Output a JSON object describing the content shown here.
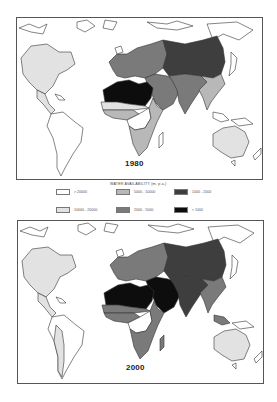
{
  "maps": [
    {
      "year": "1980",
      "region_classes": {
        "north_america": "c10000_20000",
        "central_america": "c10000_20000",
        "south_america": "c_gt20000",
        "europe": "c2000_5000",
        "north_africa": "c_lt1000",
        "sahel": "c10000_20000",
        "west_africa": "c5000_10000",
        "central_africa": "c_gt20000",
        "east_southern_africa": "c5000_10000",
        "middle_east": "c2000_5000",
        "central_asia_china": "c1000_2000",
        "south_asia": "c2000_5000",
        "southeast_asia": "c5000_10000",
        "australia": "c10000_20000"
      }
    },
    {
      "year": "2000",
      "region_classes": {
        "north_america": "c10000_20000",
        "central_america": "c10000_20000",
        "south_america": "c_gt20000",
        "south_america_andes": "c10000_20000",
        "europe": "c2000_5000",
        "north_africa": "c_lt1000",
        "sahel": "c2000_5000",
        "west_africa": "c2000_5000",
        "central_africa": "c_gt20000",
        "east_southern_africa": "c2000_5000",
        "middle_east": "c_lt1000",
        "central_asia_china": "c1000_2000",
        "south_asia": "c1000_2000",
        "southeast_asia": "c2000_5000",
        "australia": "c10000_20000"
      }
    }
  ],
  "legend": {
    "title": "WATER AVAILABILITY  (m³ p.a.)",
    "items": [
      {
        "key": "c_gt20000",
        "label": "> 20000",
        "color": "#ffffff"
      },
      {
        "key": "c10000_20000",
        "label": "10000 - 20000",
        "color": "#e2e2e2"
      },
      {
        "key": "c5000_10000",
        "label": "5000 - 10000",
        "color": "#b8b8b8"
      },
      {
        "key": "c2000_5000",
        "label": "2000 - 5000",
        "color": "#7a7a7a"
      },
      {
        "key": "c1000_2000",
        "label": "1000 - 2000",
        "color": "#3e3e3e"
      },
      {
        "key": "c_lt1000",
        "label": "< 1000",
        "color": "#0d0d0d"
      }
    ]
  }
}
